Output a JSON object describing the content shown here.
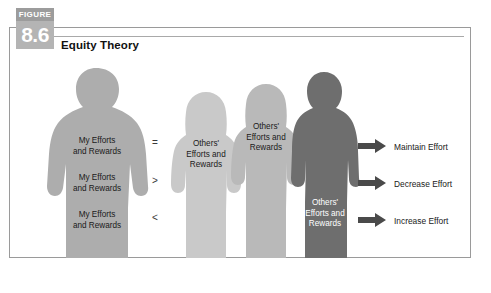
{
  "figure": {
    "badge_word": "FIGURE",
    "number": "8.6",
    "title": "Equity Theory"
  },
  "colors": {
    "self_figure": "#adadad",
    "other_figure_light": "#c9c9c9",
    "other_figure_mid": "#b9b9b9",
    "other_figure_dark": "#6e6e6e",
    "arrow": "#4a4a4a",
    "border": "#9a9a9a",
    "badge_top": "#9c9c9c",
    "badge_body": "#b4b4b4",
    "text": "#1a1a1a",
    "text_inverse": "#ffffff"
  },
  "self_figure": {
    "name": "self-silhouette",
    "labels": [
      "My Efforts\nand Rewards",
      "My Efforts\nand Rewards",
      "My Efforts\nand Rewards"
    ]
  },
  "comparisons": [
    {
      "operator": "=",
      "outcome": "Maintain Effort"
    },
    {
      "operator": ">",
      "outcome": "Decrease Effort"
    },
    {
      "operator": "<",
      "outcome": "Increase Effort"
    }
  ],
  "other_figures": [
    {
      "name": "other-silhouette-equal",
      "type": "female",
      "shade": "light",
      "label": "Others'\nEfforts and\nRewards"
    },
    {
      "name": "other-silhouette-greater",
      "type": "female",
      "shade": "mid",
      "label": "Others'\nEfforts and\nRewards"
    },
    {
      "name": "other-silhouette-less",
      "type": "male",
      "shade": "dark",
      "label": "Others'\nEfforts and\nRewards"
    }
  ]
}
